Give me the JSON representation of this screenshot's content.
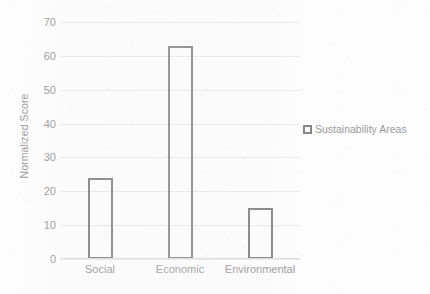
{
  "chart_data": {
    "type": "bar",
    "title": "",
    "xlabel": "",
    "ylabel": "Normalized Score",
    "categories": [
      "Social",
      "Economic",
      "Environmental"
    ],
    "values": [
      24,
      63,
      15
    ],
    "series": [
      {
        "name": "Sustainability Areas",
        "values": [
          24,
          63,
          15
        ]
      }
    ],
    "ylim": [
      0,
      70
    ],
    "yticks": [
      0,
      10,
      20,
      30,
      40,
      50,
      60,
      70
    ],
    "ytick_labels": [
      "0",
      "10",
      "20",
      "30",
      "40",
      "50",
      "60",
      "70"
    ],
    "grid": true,
    "grid_axis": "y",
    "legend": {
      "position": "right",
      "entries": [
        {
          "label": "Sustainability Areas",
          "marker": "hollow-square",
          "color": "#848484"
        }
      ]
    },
    "bar_style": {
      "fill": "none",
      "edge_color": "#848484",
      "edge_width": 2
    },
    "colors": {
      "background": "#fdfdfd",
      "text": "#9a9a9a",
      "gridline": "#e9e9ea",
      "axis": "#dcdcdd",
      "bar_edge": "#848484"
    }
  }
}
